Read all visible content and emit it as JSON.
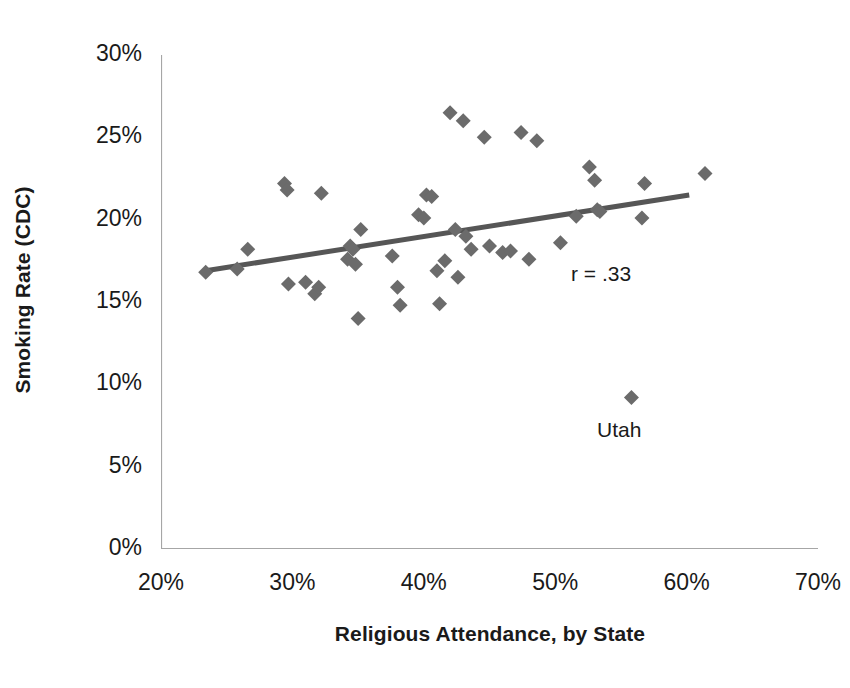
{
  "chart_data": {
    "type": "scatter",
    "title": "",
    "xlabel": "Religious Attendance, by State",
    "ylabel": "Smoking Rate (CDC)",
    "xlim": [
      20,
      70
    ],
    "ylim": [
      0,
      30
    ],
    "xticks": [
      "20%",
      "30%",
      "40%",
      "50%",
      "60%",
      "70%"
    ],
    "xtick_values": [
      20,
      30,
      40,
      50,
      60,
      70
    ],
    "yticks": [
      "0%",
      "5%",
      "10%",
      "15%",
      "20%",
      "25%",
      "30%"
    ],
    "ytick_values": [
      0,
      5,
      10,
      15,
      20,
      25,
      30
    ],
    "grid": false,
    "legend": "none",
    "marker": "diamond",
    "marker_color": "#6b6b6b",
    "trendline_color": "#565656",
    "axis_color": "#a6a6a6",
    "series": [
      {
        "name": "States",
        "points": [
          [
            23.4,
            16.8
          ],
          [
            25.8,
            17.0
          ],
          [
            26.6,
            18.2
          ],
          [
            29.4,
            22.2
          ],
          [
            29.6,
            21.8
          ],
          [
            29.7,
            16.1
          ],
          [
            31.0,
            16.2
          ],
          [
            31.7,
            15.5
          ],
          [
            32.0,
            15.9
          ],
          [
            32.2,
            21.6
          ],
          [
            34.2,
            17.6
          ],
          [
            34.4,
            18.4
          ],
          [
            34.6,
            18.2
          ],
          [
            34.8,
            17.3
          ],
          [
            35.0,
            14.0
          ],
          [
            35.2,
            19.4
          ],
          [
            37.6,
            17.8
          ],
          [
            38.0,
            15.9
          ],
          [
            38.2,
            14.8
          ],
          [
            39.6,
            20.3
          ],
          [
            40.0,
            20.1
          ],
          [
            40.2,
            21.5
          ],
          [
            40.6,
            21.4
          ],
          [
            41.0,
            16.9
          ],
          [
            41.2,
            14.9
          ],
          [
            41.6,
            17.5
          ],
          [
            42.0,
            26.5
          ],
          [
            42.4,
            19.4
          ],
          [
            42.6,
            16.5
          ],
          [
            43.0,
            26.0
          ],
          [
            43.2,
            19.0
          ],
          [
            43.6,
            18.2
          ],
          [
            44.6,
            25.0
          ],
          [
            45.0,
            18.4
          ],
          [
            46.0,
            18.0
          ],
          [
            46.6,
            18.1
          ],
          [
            47.4,
            25.3
          ],
          [
            48.0,
            17.6
          ],
          [
            48.6,
            24.8
          ],
          [
            50.4,
            18.6
          ],
          [
            51.6,
            20.2
          ],
          [
            52.6,
            23.2
          ],
          [
            53.0,
            22.4
          ],
          [
            53.2,
            20.6
          ],
          [
            53.4,
            20.5
          ],
          [
            55.8,
            9.2
          ],
          [
            56.6,
            20.1
          ],
          [
            56.8,
            22.2
          ],
          [
            61.4,
            22.8
          ]
        ]
      }
    ],
    "trendline": {
      "x_start": 23.4,
      "y_start": 16.9,
      "x_end": 60.2,
      "y_end": 21.5
    },
    "annotations": [
      {
        "id": "correlation",
        "text": "r = .33",
        "x": 53.5,
        "y": 15.8
      },
      {
        "id": "utah-label",
        "text": "Utah",
        "x": 55.8,
        "y": 6.5
      }
    ]
  }
}
